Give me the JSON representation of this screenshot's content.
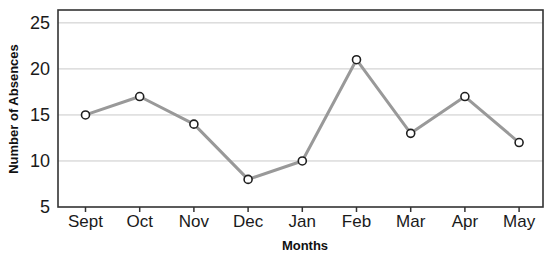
{
  "chart_data": {
    "type": "line",
    "title": "",
    "xlabel": "Months",
    "ylabel": "Number of Absences",
    "categories": [
      "Sept",
      "Oct",
      "Nov",
      "Dec",
      "Jan",
      "Feb",
      "Mar",
      "Apr",
      "May"
    ],
    "values": [
      15,
      17,
      14,
      8,
      10,
      21,
      13,
      17,
      12
    ],
    "yticks": [
      5,
      10,
      15,
      20,
      25
    ],
    "ylim": [
      5,
      26.4
    ],
    "grid": true,
    "legend": "none",
    "colors": {
      "line": "#999999",
      "marker_fill": "#ffffff",
      "marker_stroke": "#1f1f1f",
      "gridline": "#c9c9c9",
      "axis": "#333333",
      "text": "#111111",
      "background": "#ffffff"
    }
  }
}
